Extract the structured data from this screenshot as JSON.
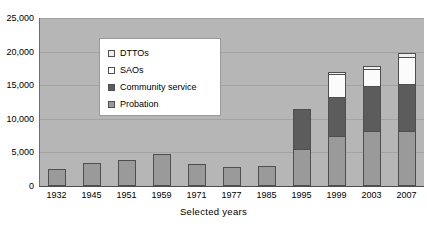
{
  "chart_data": {
    "type": "bar",
    "subtype": "stacked-bar",
    "title": "",
    "xlabel": "Selected years",
    "ylabel": "",
    "ylim": [
      0,
      25000
    ],
    "ytick_values": [
      0,
      5000,
      10000,
      15000,
      20000,
      25000
    ],
    "ytick_labels": [
      "0",
      "5,000",
      "10,000",
      "15,000",
      "20,000",
      "25,000"
    ],
    "grid": true,
    "legend_position": "upper-left-inside",
    "categories": [
      "1932",
      "1945",
      "1951",
      "1959",
      "1971",
      "1977",
      "1985",
      "1995",
      "1999",
      "2003",
      "2007"
    ],
    "series": [
      {
        "name": "Probation",
        "color": "#9a9a9a",
        "values": [
          2400,
          3300,
          3700,
          4600,
          3200,
          2700,
          2900,
          5300,
          7300,
          8000,
          8100
        ]
      },
      {
        "name": "Community service",
        "color": "#5c5c5c",
        "values": [
          0,
          0,
          0,
          0,
          0,
          0,
          0,
          6000,
          5800,
          6800,
          6900
        ]
      },
      {
        "name": "SAOs",
        "color": "#ffffff",
        "values": [
          0,
          0,
          0,
          0,
          0,
          0,
          0,
          0,
          3400,
          2500,
          4100
        ]
      },
      {
        "name": "DTTOs",
        "color": "#efefef",
        "values": [
          0,
          0,
          0,
          0,
          0,
          0,
          0,
          0,
          300,
          400,
          500
        ]
      }
    ],
    "totals": [
      2400,
      3300,
      3700,
      4600,
      3200,
      2700,
      2900,
      11300,
      16800,
      17700,
      19600
    ]
  },
  "legend": {
    "items": [
      {
        "label": "DTTOs",
        "swatch": "dttos-swatch"
      },
      {
        "label": "SAOs",
        "swatch": "saos-swatch"
      },
      {
        "label": "Community service",
        "swatch": "community-service-swatch"
      },
      {
        "label": "Probation",
        "swatch": "probation-swatch"
      }
    ]
  },
  "colors": {
    "plot_background": "#b6b6b6",
    "gridline": "#a3a3a3",
    "axis": "#4d4d4d",
    "bar_outline": "#4f4f4f",
    "page_background": "#ffffff"
  }
}
